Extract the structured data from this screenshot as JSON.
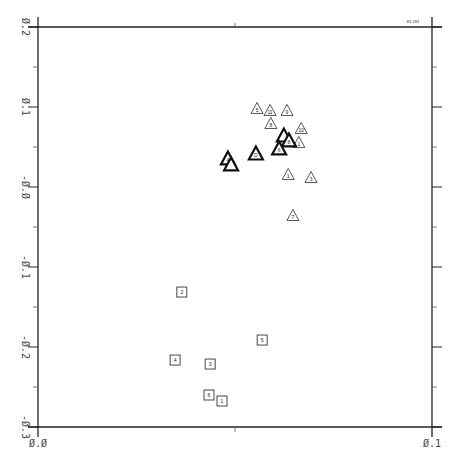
{
  "chart_data": {
    "type": "scatter",
    "title": "",
    "corner_label": "83-284",
    "xlabel": "",
    "ylabel": "",
    "xlim": [
      0.0,
      0.1
    ],
    "ylim": [
      -0.3,
      0.2
    ],
    "x_ticks": [
      {
        "value": 0.0,
        "label": "0.0"
      },
      {
        "value": 0.1,
        "label": "0.1"
      }
    ],
    "x_minor_ticks": [
      0.05
    ],
    "y_ticks": [
      {
        "value": 0.2,
        "label": "0.2"
      },
      {
        "value": 0.1,
        "label": "0.1"
      },
      {
        "value": 0.0,
        "label": "-0.0"
      },
      {
        "value": -0.1,
        "label": "-0.1"
      },
      {
        "value": -0.2,
        "label": "-0.2"
      },
      {
        "value": -0.3,
        "label": "-0.3"
      }
    ],
    "y_minor_ticks": [
      0.15,
      0.05,
      -0.05,
      -0.15,
      -0.25
    ],
    "grid": false,
    "legend": null,
    "series": [
      {
        "name": "triangles",
        "marker": "triangle",
        "points": [
          {
            "x": 0.0556,
            "y": 0.0988,
            "label": "5"
          },
          {
            "x": 0.0589,
            "y": 0.0963,
            "label": "11"
          },
          {
            "x": 0.0632,
            "y": 0.0963,
            "label": "9"
          },
          {
            "x": 0.0591,
            "y": 0.08,
            "label": "8"
          },
          {
            "x": 0.0668,
            "y": 0.0738,
            "label": "10"
          },
          {
            "x": 0.0662,
            "y": 0.0563,
            "label": "1"
          },
          {
            "x": 0.0635,
            "y": 0.0163,
            "label": "1"
          },
          {
            "x": 0.0693,
            "y": 0.0125,
            "label": "3"
          },
          {
            "x": 0.0647,
            "y": -0.035,
            "label": "7"
          }
        ]
      },
      {
        "name": "bold-triangles",
        "marker": "triangle-bold",
        "points": [
          {
            "x": 0.0624,
            "y": 0.065,
            "label": ""
          },
          {
            "x": 0.0637,
            "y": 0.0588,
            "label": "8"
          },
          {
            "x": 0.0612,
            "y": 0.0488,
            "label": "6"
          },
          {
            "x": 0.0553,
            "y": 0.0425,
            "label": "D"
          },
          {
            "x": 0.0482,
            "y": 0.0363,
            "label": "4"
          },
          {
            "x": 0.049,
            "y": 0.0288,
            "label": ""
          }
        ]
      },
      {
        "name": "squares",
        "marker": "square",
        "points": [
          {
            "x": 0.0365,
            "y": -0.1313,
            "label": "2"
          },
          {
            "x": 0.0569,
            "y": -0.1913,
            "label": "5"
          },
          {
            "x": 0.0348,
            "y": -0.2163,
            "label": "4"
          },
          {
            "x": 0.0437,
            "y": -0.2213,
            "label": "3"
          },
          {
            "x": 0.0434,
            "y": -0.26,
            "label": "6"
          },
          {
            "x": 0.0467,
            "y": -0.2675,
            "label": "1"
          }
        ]
      }
    ]
  }
}
